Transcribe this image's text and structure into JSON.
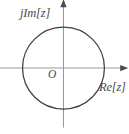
{
  "figure": {
    "name": "unit-circle-complex-plane",
    "background_color": "#ffffff",
    "width": 129,
    "height": 134
  },
  "labels": {
    "imaginary_axis": "jIm[z]",
    "real_axis": "Re[z]",
    "origin": "O"
  },
  "colors": {
    "circle_stroke": "#3f3f3f",
    "axis_stroke": "#9a9a9a",
    "arrow_fill": "#4a4a4a",
    "text": "#4a4a4a"
  },
  "chart_data": {
    "type": "scatter",
    "title": "",
    "subtitle": "",
    "xlabel": "Re[z]",
    "ylabel": "jIm[z]",
    "grid": false,
    "legend": null,
    "xlim": [
      -1.55,
      1.6
    ],
    "ylim": [
      -1.55,
      1.6
    ],
    "series": [
      {
        "name": "unit circle",
        "shape": "circle",
        "center": [
          0,
          0
        ],
        "radius": 1,
        "filled": false
      }
    ],
    "annotations": [
      {
        "text": "jIm[z]",
        "x": -1.05,
        "y": 1.5,
        "role": "axis-label"
      },
      {
        "text": "Re[z]",
        "x": 1.05,
        "y": -0.42,
        "role": "axis-label"
      },
      {
        "text": "O",
        "x": -0.26,
        "y": -0.18,
        "role": "origin-label"
      }
    ],
    "axes": {
      "x_axis": {
        "from": [
          -1.55,
          0
        ],
        "to": [
          1.58,
          0
        ],
        "arrow": "end"
      },
      "y_axis": {
        "from": [
          0,
          -1.4
        ],
        "to": [
          0,
          1.62
        ],
        "arrow": "end"
      }
    },
    "tick_labels": {
      "x": [],
      "y": []
    }
  }
}
